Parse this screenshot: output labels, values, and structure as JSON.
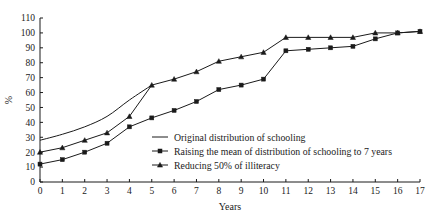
{
  "chart_data": {
    "type": "line",
    "title": "",
    "xlabel": "Years",
    "ylabel": "%",
    "xlim": [
      0,
      17
    ],
    "ylim": [
      0,
      110
    ],
    "grid": false,
    "legend_position": "inside-center-right",
    "xticks": [
      "0",
      "1",
      "2",
      "3",
      "4",
      "5",
      "6",
      "7",
      "8",
      "9",
      "10",
      "11",
      "12",
      "13",
      "14",
      "15",
      "16",
      "17"
    ],
    "yticks": [
      "0",
      "10",
      "20",
      "30",
      "40",
      "50",
      "60",
      "70",
      "80",
      "90",
      "100",
      "110"
    ],
    "x": [
      0,
      1,
      2,
      3,
      4,
      5,
      6,
      7,
      8,
      9,
      10,
      11,
      12,
      13,
      14,
      15,
      16,
      17
    ],
    "series": [
      {
        "name": "Original distribution of schooling",
        "marker": "none",
        "x": [
          0,
          1,
          2,
          3,
          4,
          5
        ],
        "values": [
          28,
          32,
          37,
          44,
          55,
          65
        ]
      },
      {
        "name": "Raising the mean of distribution of schooling to 7 years",
        "marker": "square",
        "values": [
          12,
          15,
          20,
          26,
          37,
          43,
          48,
          54,
          62,
          65,
          69,
          88,
          89,
          90,
          91,
          96,
          100,
          101
        ]
      },
      {
        "name": "Reducing 50% of illiteracy",
        "marker": "triangle",
        "values": [
          20,
          23,
          28,
          33,
          44,
          65,
          69,
          74,
          81,
          84,
          87,
          97,
          97,
          97,
          97,
          100,
          100,
          101
        ]
      }
    ]
  }
}
